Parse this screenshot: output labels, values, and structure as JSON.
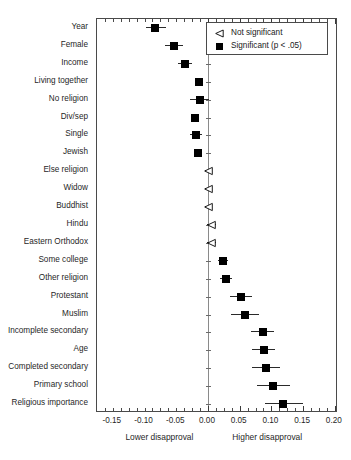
{
  "figure": {
    "axis": {
      "xlabel_left": "Lower disapproval",
      "xlabel_right": "Higher disapproval",
      "tick_labels": [
        "-0.15",
        "-0.10",
        "-0.05",
        "0.00",
        "0.05",
        "0.10",
        "0.15",
        "0.20"
      ],
      "tick_values": [
        -0.15,
        -0.1,
        -0.05,
        0.0,
        0.05,
        0.1,
        0.15,
        0.2
      ]
    },
    "legend": {
      "items": [
        {
          "label": "Not significant",
          "glyph": "triangle-outline-icon"
        },
        {
          "label": "Significant (p < .05)",
          "glyph": "square-filled-icon"
        }
      ]
    }
  },
  "chart_data": {
    "type": "scatter",
    "subtype": "forest-plot",
    "title": "",
    "xlabel": "",
    "ylabel": "",
    "xlim": [
      -0.175,
      0.205
    ],
    "grid": false,
    "zero_reference_line": 0.0,
    "legend_position": "top-right",
    "xtick_labels": [
      "-0.15",
      "-0.10",
      "-0.05",
      "0.00",
      "0.05",
      "0.10",
      "0.15",
      "0.20"
    ],
    "xticks": [
      -0.15,
      -0.1,
      -0.05,
      0.0,
      0.05,
      0.1,
      0.15,
      0.2
    ],
    "categories": [
      "Year",
      "Female",
      "Income",
      "Living together",
      "No religion",
      "Div/sep",
      "Single",
      "Jewish",
      "Else religion",
      "Widow",
      "Buddhist",
      "Hindu",
      "Eastern Orthodox",
      "Some college",
      "Other religion",
      "Protestant",
      "Muslim",
      "Incomplete secondary",
      "Age",
      "Completed secondary",
      "Primary school",
      "Religious importance"
    ],
    "points": [
      {
        "label": "Year",
        "estimate": -0.083,
        "ci_low": -0.098,
        "ci_high": -0.066,
        "significant": true
      },
      {
        "label": "Female",
        "estimate": -0.053,
        "ci_low": -0.068,
        "ci_high": -0.039,
        "significant": true
      },
      {
        "label": "Income",
        "estimate": -0.036,
        "ci_low": -0.047,
        "ci_high": -0.025,
        "significant": true
      },
      {
        "label": "Living together",
        "estimate": -0.014,
        "ci_low": -0.02,
        "ci_high": -0.008,
        "significant": true
      },
      {
        "label": "No religion",
        "estimate": -0.013,
        "ci_low": -0.029,
        "ci_high": 0.001,
        "significant": true
      },
      {
        "label": "Div/sep",
        "estimate": -0.021,
        "ci_low": -0.024,
        "ci_high": -0.017,
        "significant": true
      },
      {
        "label": "Single",
        "estimate": -0.019,
        "ci_low": -0.028,
        "ci_high": -0.01,
        "significant": true
      },
      {
        "label": "Jewish",
        "estimate": -0.015,
        "ci_low": -0.02,
        "ci_high": -0.009,
        "significant": true
      },
      {
        "label": "Else religion",
        "estimate": 0.0,
        "ci_low": -0.004,
        "ci_high": 0.004,
        "significant": false
      },
      {
        "label": "Widow",
        "estimate": 0.0,
        "ci_low": -0.004,
        "ci_high": 0.005,
        "significant": false
      },
      {
        "label": "Buddhist",
        "estimate": 0.0,
        "ci_low": -0.004,
        "ci_high": 0.005,
        "significant": false
      },
      {
        "label": "Hindu",
        "estimate": 0.004,
        "ci_low": -0.002,
        "ci_high": 0.013,
        "significant": false
      },
      {
        "label": "Eastern Orthodox",
        "estimate": 0.004,
        "ci_low": -0.002,
        "ci_high": 0.012,
        "significant": false
      },
      {
        "label": "Some college",
        "estimate": 0.024,
        "ci_low": 0.016,
        "ci_high": 0.032,
        "significant": true
      },
      {
        "label": "Other religion",
        "estimate": 0.028,
        "ci_low": 0.019,
        "ci_high": 0.038,
        "significant": true
      },
      {
        "label": "Protestant",
        "estimate": 0.052,
        "ci_low": 0.034,
        "ci_high": 0.069,
        "significant": true
      },
      {
        "label": "Muslim",
        "estimate": 0.058,
        "ci_low": 0.036,
        "ci_high": 0.08,
        "significant": true
      },
      {
        "label": "Incomplete secondary",
        "estimate": 0.086,
        "ci_low": 0.068,
        "ci_high": 0.104,
        "significant": true
      },
      {
        "label": "Age",
        "estimate": 0.088,
        "ci_low": 0.07,
        "ci_high": 0.106,
        "significant": true
      },
      {
        "label": "Completed secondary",
        "estimate": 0.091,
        "ci_low": 0.069,
        "ci_high": 0.114,
        "significant": true
      },
      {
        "label": "Primary school",
        "estimate": 0.102,
        "ci_low": 0.078,
        "ci_high": 0.129,
        "significant": true
      },
      {
        "label": "Religious importance",
        "estimate": 0.119,
        "ci_low": 0.09,
        "ci_high": 0.15,
        "significant": true
      }
    ]
  }
}
